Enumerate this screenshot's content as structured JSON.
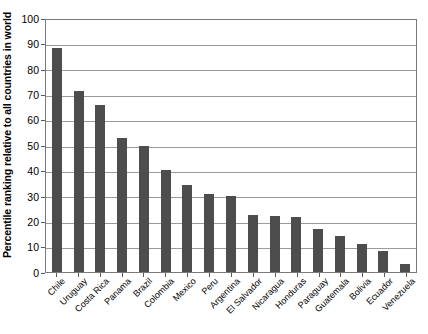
{
  "chart_data": {
    "type": "bar",
    "title": "",
    "xlabel": "",
    "ylabel": "Percentile ranking relative to all countries in world",
    "ylim": [
      0,
      100
    ],
    "ytick_labels": [
      "100",
      "90",
      "80",
      "70",
      "60",
      "50",
      "40",
      "30",
      "20",
      "10",
      "0"
    ],
    "yticks": [
      100,
      90,
      80,
      70,
      60,
      50,
      40,
      30,
      20,
      10,
      0
    ],
    "grid": true,
    "legend": "none",
    "bar_color": "#4d4d4d",
    "categories": [
      "Chile",
      "Uruguay",
      "Costa Rica",
      "Panama",
      "Brazil",
      "Colombia",
      "Mexico",
      "Peru",
      "Argentina",
      "El Salvador",
      "Nicaragua",
      "Honduras",
      "Paraguay",
      "Guatemala",
      "Bolivia",
      "Ecuador",
      "Venezuela"
    ],
    "values": [
      88,
      71,
      65.5,
      52.5,
      49.5,
      40,
      34,
      30.5,
      30,
      22.5,
      22,
      21.5,
      17,
      14,
      11,
      8,
      3
    ]
  }
}
